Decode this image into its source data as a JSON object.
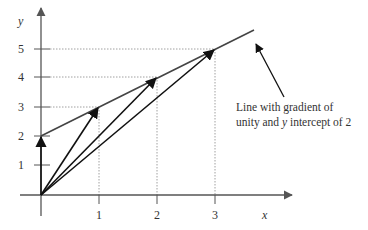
{
  "diagram": {
    "axes": {
      "x_label": "x",
      "y_label": "y",
      "x_ticks": [
        {
          "value": 1,
          "label": "1"
        },
        {
          "value": 2,
          "label": "2"
        },
        {
          "value": 3,
          "label": "3"
        }
      ],
      "y_ticks": [
        {
          "value": 1,
          "label": "1"
        },
        {
          "value": 2,
          "label": "2"
        },
        {
          "value": 3,
          "label": "3"
        },
        {
          "value": 4,
          "label": "4"
        },
        {
          "value": 5,
          "label": "5"
        }
      ]
    },
    "line": {
      "gradient": 1,
      "y_intercept": 2
    },
    "vectors_from_origin": [
      {
        "to": [
          0,
          2
        ]
      },
      {
        "to": [
          1,
          3
        ]
      },
      {
        "to": [
          2,
          4
        ]
      },
      {
        "to": [
          3,
          5
        ]
      }
    ],
    "annotation": {
      "line1": "Line with gradient of",
      "line2_a": "unity and ",
      "line2_y": "y",
      "line2_b": " intercept of 2"
    },
    "colors": {
      "axis": "#555555",
      "vector": "#111111",
      "line": "#444444",
      "guide": "#888888"
    }
  }
}
